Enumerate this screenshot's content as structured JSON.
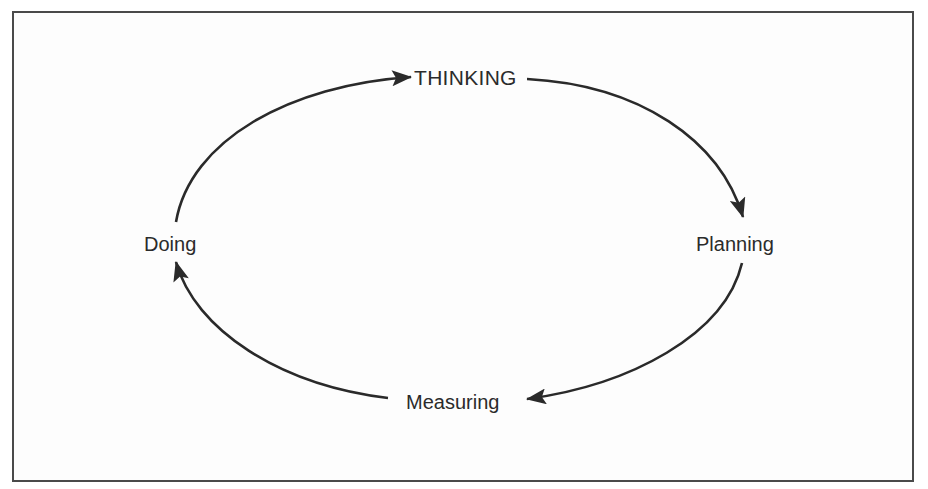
{
  "diagram": {
    "type": "cycle",
    "nodes": [
      {
        "id": "thinking",
        "label": "THINKING"
      },
      {
        "id": "planning",
        "label": "Planning"
      },
      {
        "id": "measuring",
        "label": "Measuring"
      },
      {
        "id": "doing",
        "label": "Doing"
      }
    ],
    "edges": [
      {
        "from": "doing",
        "to": "thinking"
      },
      {
        "from": "thinking",
        "to": "planning"
      },
      {
        "from": "planning",
        "to": "measuring"
      },
      {
        "from": "measuring",
        "to": "doing"
      }
    ],
    "direction": "clockwise",
    "colors": {
      "stroke": "#2a2a2a",
      "text": "#2b2b2b",
      "border": "#4a4a4a"
    }
  }
}
